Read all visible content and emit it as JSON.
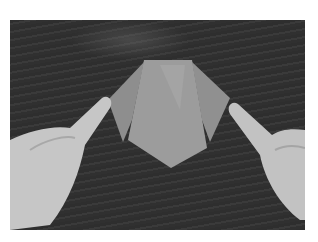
{
  "image": {
    "description": "Grayscale photo of two hands pressing down the side flaps of a folded origami piece on a dark wood table",
    "subject": "origami-fold",
    "colors": {
      "table": "#333333",
      "paper": "#8a8a8a",
      "paper_light": "#a5a5a5",
      "skin": "#c8c8c8",
      "border": "#ffffff"
    }
  }
}
